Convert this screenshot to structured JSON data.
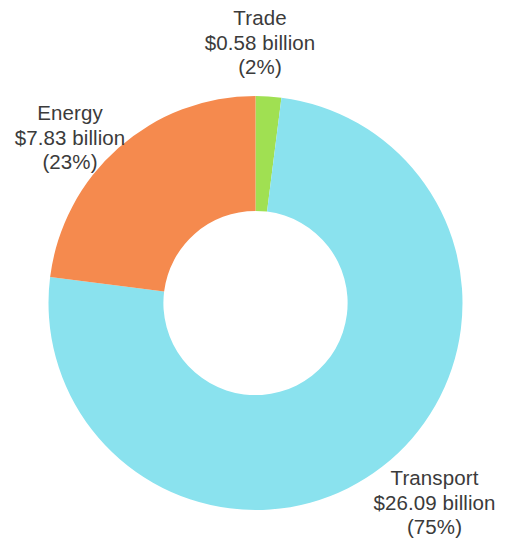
{
  "chart_data": {
    "type": "pie",
    "variant": "donut",
    "title": "",
    "subtitle": "",
    "xlabel": "",
    "ylabel": "",
    "legend_position": "none",
    "grid": false,
    "units": "billion USD",
    "start_angle_deg": 0,
    "direction": "clockwise",
    "inner_radius_ratio": 0.445,
    "categories": [
      "Trade",
      "Transport",
      "Energy"
    ],
    "values": [
      0.58,
      26.09,
      7.83
    ],
    "percentages": [
      2,
      75,
      23
    ],
    "colors": [
      "#a0e052",
      "#8ae2ee",
      "#f58a4e"
    ],
    "total": 34.5,
    "slices": [
      {
        "name": "Trade",
        "value": 0.58,
        "value_label": "$0.58 billion",
        "percent": 2,
        "percent_label": "(2%)",
        "color": "#a0e052",
        "start_deg": 0,
        "end_deg": 7.2
      },
      {
        "name": "Transport",
        "value": 26.09,
        "value_label": "$26.09 billion",
        "percent": 75,
        "percent_label": "(75%)",
        "color": "#8ae2ee",
        "start_deg": 7.2,
        "end_deg": 277.2
      },
      {
        "name": "Energy",
        "value": 7.83,
        "value_label": "$7.83 billion",
        "percent": 23,
        "percent_label": "(23%)",
        "color": "#f58a4e",
        "start_deg": 277.2,
        "end_deg": 360
      }
    ]
  },
  "labels": {
    "trade": {
      "name": "Trade",
      "value": "$0.58 billion",
      "percent": "(2%)"
    },
    "energy": {
      "name": "Energy",
      "value": "$7.83 billion",
      "percent": "(23%)"
    },
    "transport": {
      "name": "Transport",
      "value": "$26.09 billion",
      "percent": "(75%)"
    }
  },
  "theme": {
    "background": "#ffffff",
    "text_color": "#3b3b3b",
    "trade_color": "#a0e052",
    "transport_color": "#8ae2ee",
    "energy_color": "#f58a4e"
  }
}
